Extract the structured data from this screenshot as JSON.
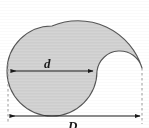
{
  "figure": {
    "kind": "geometry-diagram",
    "background_color": "#ffffff",
    "fill_color": "#d2d2d2",
    "outline_color": "#4a4a4a",
    "dimension_color": "#1a1a1a",
    "dashed_color": "#9a9a9a"
  },
  "labels": {
    "inner_diameter": "d",
    "outer_diameter": "D"
  },
  "dimensions": [
    {
      "name": "inner-diameter",
      "label": "d",
      "orientation": "horizontal",
      "x1": 11,
      "x2": 93,
      "y": 71,
      "arrowheads": "both"
    },
    {
      "name": "outer-diameter",
      "label": "D",
      "orientation": "horizontal",
      "x1": 8,
      "x2": 142,
      "y": 116,
      "arrowheads": "both"
    }
  ],
  "extension_lines": [
    {
      "name": "left-extension",
      "x": 8,
      "y1": 64,
      "y2": 124,
      "style": "dashed"
    },
    {
      "name": "right-extension",
      "x": 142,
      "y1": 68,
      "y2": 124,
      "style": "dashed"
    }
  ],
  "geometry": {
    "inner_circle": {
      "cx": 52,
      "cy": 71,
      "r": 45
    },
    "outer_arc": {
      "cx": 75,
      "cy": 71,
      "r": 67
    },
    "notch_arc": {
      "cx": 120,
      "cy": 71,
      "r": 23
    }
  }
}
